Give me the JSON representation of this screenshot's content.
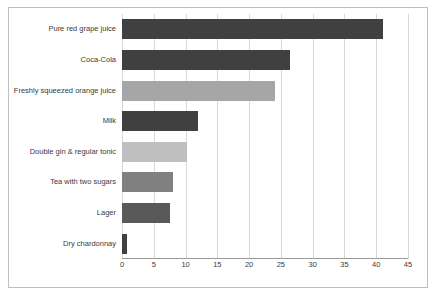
{
  "chart_data": {
    "type": "bar",
    "orientation": "horizontal",
    "title": "",
    "subtitle": "",
    "xlabel": "",
    "ylabel": "",
    "categories": [
      "Pure red grape juice",
      "Coca-Cola",
      "Freshly squeezed orange juice",
      "Milk",
      "Double gin & regular tonic",
      "Tea with two sugars",
      "Lager",
      "Dry chardonnay"
    ],
    "values": [
      41,
      26.5,
      24,
      12,
      10.2,
      8,
      7.5,
      0.8
    ],
    "bar_colors": [
      "#404040",
      "#404040",
      "#a6a6a6",
      "#404040",
      "#bfbfbf",
      "#808080",
      "#595959",
      "#404040"
    ],
    "xlim": [
      0,
      45
    ],
    "xticks": [
      0,
      5,
      10,
      15,
      20,
      25,
      30,
      35,
      40,
      45
    ],
    "xtick_labels": [
      "0",
      "5",
      "10",
      "15",
      "20",
      "25",
      "30",
      "35",
      "40",
      "45"
    ],
    "grid": true,
    "grid_axis": "x",
    "legend": false,
    "legend_position": "none",
    "background_color": "#ffffff",
    "grid_color": "#d9d9d9",
    "axis_color": "#9a9a9a",
    "border_color": "#bfbfbf"
  }
}
